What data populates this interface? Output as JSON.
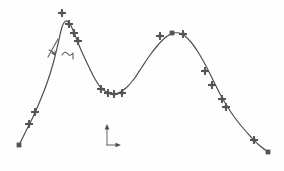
{
  "figure": {
    "title": "",
    "background_color": "#fefefe",
    "ink_color": "#4a4a4a",
    "marker_color": "#545454",
    "width": 284,
    "height": 171
  },
  "annotation": {
    "angle_mark": "angle-tick-handwritten",
    "squiggle": "tilde-squiggle-handwritten",
    "label_text": ""
  },
  "axes_icon": {
    "name": "coordinate-axes-icon",
    "x_arrow": "right-arrow",
    "y_arrow": "up-arrow",
    "origin_x": 107,
    "origin_y": 145,
    "x_tip": 120,
    "y_tip": 124
  },
  "chart_data": {
    "type": "line",
    "title": "",
    "xlabel": "",
    "ylabel": "",
    "grid": false,
    "legend": null,
    "xlim": [
      0,
      284
    ],
    "ylim": [
      171,
      0
    ],
    "note": "Hand-drawn bimodal curve, pixel coordinates (y inverted, screen space)",
    "curve_points": [
      [
        19,
        145
      ],
      [
        26,
        131
      ],
      [
        33,
        117
      ],
      [
        40,
        101
      ],
      [
        47,
        83
      ],
      [
        53,
        64
      ],
      [
        58,
        44
      ],
      [
        62,
        27
      ],
      [
        66,
        21
      ],
      [
        70,
        24
      ],
      [
        75,
        35
      ],
      [
        81,
        50
      ],
      [
        88,
        65
      ],
      [
        95,
        79
      ],
      [
        102,
        89
      ],
      [
        110,
        93
      ],
      [
        118,
        93
      ],
      [
        126,
        88
      ],
      [
        134,
        79
      ],
      [
        142,
        67
      ],
      [
        150,
        55
      ],
      [
        158,
        45
      ],
      [
        166,
        37
      ],
      [
        174,
        33
      ],
      [
        182,
        34
      ],
      [
        190,
        41
      ],
      [
        198,
        52
      ],
      [
        206,
        66
      ],
      [
        213,
        80
      ],
      [
        220,
        94
      ],
      [
        227,
        106
      ],
      [
        235,
        118
      ],
      [
        243,
        128
      ],
      [
        251,
        137
      ],
      [
        259,
        145
      ],
      [
        268,
        152
      ]
    ],
    "markers": [
      {
        "x": 19,
        "y": 145,
        "shape": "square"
      },
      {
        "x": 29,
        "y": 124,
        "shape": "cross"
      },
      {
        "x": 35,
        "y": 112,
        "shape": "cross"
      },
      {
        "x": 62,
        "y": 13,
        "shape": "cross"
      },
      {
        "x": 69,
        "y": 24,
        "shape": "cross"
      },
      {
        "x": 74,
        "y": 33,
        "shape": "cross"
      },
      {
        "x": 78,
        "y": 41,
        "shape": "cross"
      },
      {
        "x": 101,
        "y": 89,
        "shape": "cross"
      },
      {
        "x": 108,
        "y": 93,
        "shape": "cross"
      },
      {
        "x": 114,
        "y": 94,
        "shape": "cross"
      },
      {
        "x": 122,
        "y": 93,
        "shape": "cross"
      },
      {
        "x": 160,
        "y": 36,
        "shape": "cross"
      },
      {
        "x": 172,
        "y": 33,
        "shape": "square"
      },
      {
        "x": 183,
        "y": 34,
        "shape": "cross"
      },
      {
        "x": 205,
        "y": 71,
        "shape": "cross"
      },
      {
        "x": 212,
        "y": 85,
        "shape": "cross"
      },
      {
        "x": 222,
        "y": 99,
        "shape": "cross"
      },
      {
        "x": 226,
        "y": 107,
        "shape": "cross"
      },
      {
        "x": 254,
        "y": 140,
        "shape": "cross"
      },
      {
        "x": 268,
        "y": 152,
        "shape": "square"
      }
    ],
    "peaks": [
      {
        "label": "left-peak",
        "x": 66,
        "y": 21
      },
      {
        "label": "right-peak",
        "x": 174,
        "y": 33
      }
    ],
    "valleys": [
      {
        "label": "center-valley",
        "x": 114,
        "y": 94
      }
    ]
  }
}
